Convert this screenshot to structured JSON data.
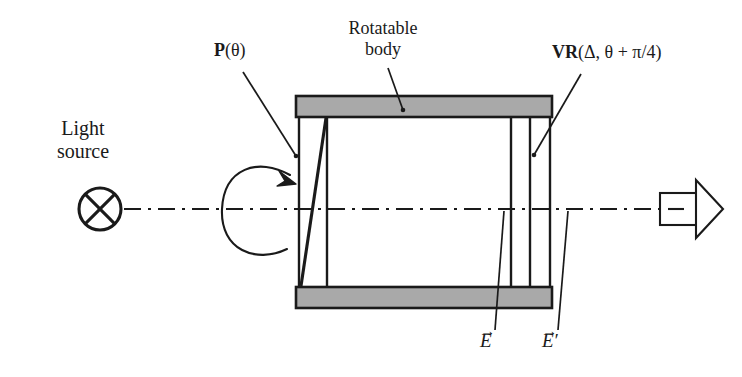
{
  "figure": {
    "background_color": "#ffffff",
    "ink_color": "#1a1a1a",
    "body_fill_color": "#a9a9a9"
  },
  "labels": {
    "light_source_line1": "Light",
    "light_source_line2": "source",
    "polarizer": "P",
    "polarizer_arg": "(θ)",
    "rotatable_line1": "Rotatable",
    "rotatable_line2": "body",
    "retarder": "VR",
    "retarder_arg": "(Δ, θ + π/4)",
    "field_in": "E",
    "field_in_arrow": "→",
    "field_out": "E",
    "field_out_arrow": "→",
    "field_out_prime": "′"
  },
  "components": {
    "light_source": {
      "name": "lamp-cross-circle",
      "cx": 100,
      "cy": 209,
      "r": 21
    },
    "optical_axis": {
      "name": "dash-dot-axis",
      "y": 209,
      "x_start": 122,
      "x_end": 660
    },
    "rotation_arrow": {
      "name": "rotation-curve-arrow",
      "center_x": 253,
      "center_y": 209
    },
    "rotatable_body": {
      "x_left": 296,
      "x_right": 552,
      "top_bar_y": 96,
      "top_bar_height": 21,
      "bottom_bar_y": 287,
      "bottom_bar_height": 21
    },
    "polarizer_element": {
      "name": "slanted-polarizer",
      "x_vertical_left": 299,
      "x_vertical_right": 327,
      "slant_top_x": 326,
      "slant_bottom_x": 301
    },
    "retarder_element": {
      "name": "variable-retarder-plate",
      "x_left": 511,
      "x_right": 530
    },
    "detector": {
      "name": "detector-arrow",
      "rect_x": 660,
      "rect_y": 193,
      "rect_width": 42,
      "rect_height": 31,
      "tip_x": 717
    }
  },
  "leaders": {
    "polarizer": {
      "from_x": 243,
      "from_y": 72,
      "to_x": 296,
      "to_y": 156
    },
    "rotatable": {
      "from_x": 388,
      "from_y": 68,
      "to_x": 402,
      "to_y": 110
    },
    "retarder": {
      "from_x": 579,
      "from_y": 74,
      "to_x": 533,
      "to_y": 155
    },
    "field_in": {
      "from_x": 497,
      "from_y": 332,
      "to_x": 504,
      "to_y": 212
    },
    "field_out": {
      "from_x": 560,
      "from_y": 332,
      "to_x": 568,
      "to_y": 212
    }
  }
}
